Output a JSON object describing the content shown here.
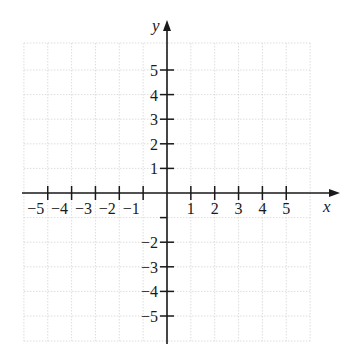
{
  "chart_data": {
    "type": "scatter",
    "title": "",
    "xlabel": "x",
    "ylabel": "y",
    "xlim": [
      -6,
      6
    ],
    "ylim": [
      -6,
      6
    ],
    "grid": true,
    "x_ticks": [
      -5,
      -4,
      -3,
      -2,
      -1,
      1,
      2,
      3,
      4,
      5
    ],
    "y_ticks": [
      -5,
      -4,
      -3,
      -2,
      1,
      2,
      3,
      4,
      5
    ],
    "x_tick_labels": [
      "−5",
      "−4",
      "−3",
      "−2",
      "−1",
      "1",
      "2",
      "3",
      "4",
      "5"
    ],
    "y_tick_labels": [
      "5",
      "4",
      "3",
      "2",
      "1",
      "−2",
      "−3",
      "−4",
      "−5"
    ],
    "series": [],
    "legend": null
  },
  "colors": {
    "axis": "#1a1a1a",
    "grid": "#d4d4d4",
    "background": "#ffffff"
  }
}
